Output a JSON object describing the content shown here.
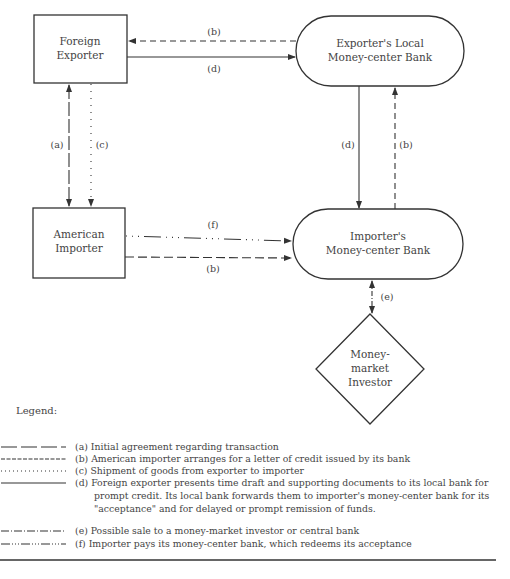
{
  "nodes": {
    "foreign_exporter": {
      "line1": "Foreign",
      "line2": "Exporter"
    },
    "exporters_bank": {
      "line1": "Exporter's Local",
      "line2": "Money-center Bank"
    },
    "american_importer": {
      "line1": "American",
      "line2": "Importer"
    },
    "importers_bank": {
      "line1": "Importer's",
      "line2": "Money-center Bank"
    },
    "investor": {
      "line1": "Money-",
      "line2": "market",
      "line3": "Investor"
    }
  },
  "edge_labels": {
    "b_top": "(b)",
    "d_top": "(d)",
    "a_left": "(a)",
    "c_left": "(c)",
    "d_right": "(d)",
    "b_right": "(b)",
    "f_mid": "(f)",
    "b_mid": "(b)",
    "e_bottom": "(e)"
  },
  "legend": {
    "title": "Legend:",
    "items": [
      {
        "key": "a",
        "text": "(a) Initial agreement  regarding transaction"
      },
      {
        "key": "b",
        "text": "(b) American importer arranges for a letter of credit issued by its bank"
      },
      {
        "key": "c",
        "text": "(c) Shipment of goods from exporter to importer"
      },
      {
        "key": "d",
        "text_line1": "(d) Foreign exporter presents time draft and supporting documents to its local bank for",
        "text_line2": "prompt credit. Its local bank forwards them to importer's money-center bank for its",
        "text_line3": "\"acceptance\" and for delayed or prompt remission of funds."
      },
      {
        "key": "e",
        "text": "(e) Possible sale to a money-market investor or central bank"
      },
      {
        "key": "f",
        "text": "(f) Importer pays its money-center bank, which redeems its acceptance"
      }
    ]
  }
}
